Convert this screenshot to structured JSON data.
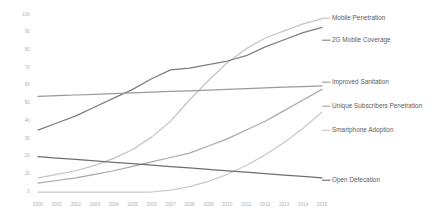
{
  "chart_data": {
    "type": "line",
    "title": "",
    "subtitle": "",
    "xlabel": "",
    "ylabel": "",
    "grid": false,
    "legend_position": "right-inline",
    "xlim": [
      2000,
      2015
    ],
    "ylim": [
      0,
      100
    ],
    "x": [
      2000,
      2001,
      2002,
      2003,
      2004,
      2005,
      2006,
      2007,
      2008,
      2009,
      2010,
      2011,
      2012,
      2013,
      2014,
      2015
    ],
    "categories": [
      "2000",
      "2001",
      "2002",
      "2003",
      "2004",
      "2005",
      "2006",
      "2007",
      "2008",
      "2009",
      "2010",
      "2011",
      "2012",
      "2013",
      "2014",
      "2015"
    ],
    "ytick_labels": [
      "100",
      "90",
      "80",
      "70",
      "60",
      "50",
      "40",
      "30",
      "20",
      "10",
      "0"
    ],
    "ytick_values": [
      100,
      90,
      80,
      70,
      60,
      50,
      40,
      30,
      20,
      10,
      0
    ],
    "series": [
      {
        "name": "Mobile Penetration",
        "color": "#c4c4c4",
        "values": [
          8,
          10,
          12,
          15,
          19,
          24,
          31,
          40,
          52,
          63,
          73,
          81,
          87,
          91,
          95,
          98
        ]
      },
      {
        "name": "2G Mobile Coverage",
        "color": "#7d7d7d",
        "values": [
          35,
          39,
          43,
          48,
          53,
          58,
          64,
          69,
          70,
          72,
          74,
          77,
          82,
          86,
          90,
          93
        ]
      },
      {
        "name": "Improved Sanitation",
        "color": "#9a9a9a",
        "values": [
          54,
          54.4,
          54.8,
          55.2,
          55.6,
          56,
          56.4,
          56.8,
          57.2,
          57.6,
          58,
          58.4,
          58.8,
          59.2,
          59.6,
          60
        ]
      },
      {
        "name": "Unique Subscribers Penetration",
        "color": "#a8a8a8",
        "values": [
          5,
          6.5,
          8,
          10,
          12,
          14.5,
          17,
          19.5,
          22,
          26,
          30,
          35,
          40,
          46,
          52,
          58
        ]
      },
      {
        "name": "Smartphone Adoption",
        "color": "#c9c9c9",
        "values": [
          0,
          0,
          0,
          0,
          0,
          0,
          0,
          1,
          3,
          6,
          10,
          15,
          21,
          28,
          36,
          45
        ]
      },
      {
        "name": "Open Defecation",
        "color": "#6e6e6e",
        "values": [
          20,
          19.2,
          18.4,
          17.6,
          16.8,
          16,
          15.2,
          14.4,
          13.6,
          12.8,
          12,
          11.2,
          10.4,
          9.6,
          8.8,
          8
        ]
      }
    ],
    "series_labels": [
      {
        "text": "Mobile Penetration",
        "x": 332,
        "y": 15
      },
      {
        "text": "2G Mobile Coverage",
        "x": 332,
        "y": 37
      },
      {
        "text": "Improved Sanitation",
        "x": 332,
        "y": 79
      },
      {
        "text": "Unique Subscribers Penetration",
        "x": 332,
        "y": 103
      },
      {
        "text": "Smartphone Adoption",
        "x": 332,
        "y": 127
      },
      {
        "text": "Open Defecation",
        "x": 332,
        "y": 177
      }
    ]
  }
}
